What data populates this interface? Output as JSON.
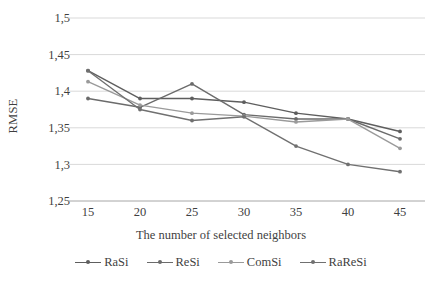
{
  "chart_data": {
    "type": "line",
    "title": "",
    "xlabel": "The number of selected neighbors",
    "ylabel": "RMSE",
    "x": [
      15,
      20,
      25,
      30,
      35,
      40,
      45
    ],
    "xticklabels": [
      "15",
      "20",
      "25",
      "30",
      "35",
      "40",
      "45"
    ],
    "yticklabels": [
      "1,5",
      "1,45",
      "1,4",
      "1,35",
      "1,3",
      "1,25"
    ],
    "yticks": [
      1.5,
      1.45,
      1.4,
      1.35,
      1.3,
      1.25
    ],
    "ylim": [
      1.25,
      1.5
    ],
    "xlim": [
      15,
      45
    ],
    "grid": "horizontal",
    "legend_position": "bottom",
    "series": [
      {
        "name": "RaSi",
        "color": "#5e5e5e",
        "values": [
          1.428,
          1.39,
          1.39,
          1.385,
          1.37,
          1.362,
          1.345
        ]
      },
      {
        "name": "ReSi",
        "color": "#6b6b6b",
        "values": [
          1.39,
          1.378,
          1.41,
          1.368,
          1.362,
          1.362,
          1.335
        ]
      },
      {
        "name": "ComSi",
        "color": "#9a9a9a",
        "values": [
          1.413,
          1.381,
          1.37,
          1.366,
          1.358,
          1.362,
          1.322
        ]
      },
      {
        "name": "RaReSi",
        "color": "#707070",
        "values": [
          1.428,
          1.375,
          1.36,
          1.365,
          1.325,
          1.3,
          1.29
        ]
      }
    ]
  },
  "style": {
    "grid_color": "#d9d9d9",
    "axis_color": "#a6a6a6",
    "text_color": "#3f3f3f",
    "background": "#ffffff"
  }
}
